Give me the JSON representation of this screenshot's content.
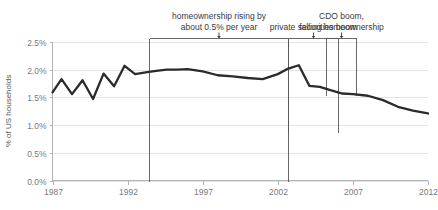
{
  "chart_data": {
    "type": "line",
    "title": "",
    "xlabel": "",
    "ylabel": "% of US households",
    "xlim": [
      1987,
      2012
    ],
    "ylim": [
      0.0,
      2.5
    ],
    "grid": true,
    "legend": "none",
    "x_ticks": [
      "1987",
      "1992",
      "1997",
      "2002",
      "2007",
      "2012"
    ],
    "x_tick_values": [
      1987,
      1992,
      1997,
      2002,
      2007,
      2012
    ],
    "y_ticks": [
      "0.0%",
      "0.5%",
      "1.0%",
      "1.5%",
      "2.0%",
      "2.5%"
    ],
    "y_tick_values": [
      0.0,
      0.5,
      1.0,
      1.5,
      2.0,
      2.5
    ],
    "series": [
      {
        "name": "% of US households",
        "x": [
          1987,
          1987.6,
          1988.3,
          1989.0,
          1989.7,
          1990.4,
          1991.1,
          1991.8,
          1992.5,
          1993.2,
          1993.9,
          1994.6,
          1995.3,
          1996.0,
          1997.0,
          1998.0,
          1999.0,
          2000.0,
          2001.0,
          2002.0,
          2002.7,
          2003.4,
          2004.1,
          2004.8,
          2005.5,
          2006.3,
          2007.0,
          2008.0,
          2009.0,
          2010.0,
          2011.0,
          2012.0
        ],
        "values": [
          1.59,
          1.83,
          1.56,
          1.81,
          1.47,
          1.93,
          1.7,
          2.07,
          1.92,
          1.95,
          1.98,
          2.0,
          2.0,
          2.01,
          1.97,
          1.9,
          1.88,
          1.85,
          1.83,
          1.92,
          2.02,
          2.08,
          1.71,
          1.69,
          1.63,
          1.57,
          1.56,
          1.53,
          1.45,
          1.33,
          1.26,
          1.21
        ]
      }
    ],
    "annotations": [
      {
        "id": "homeownership-rising",
        "lines": [
          "homeownership rising by",
          "about 0.5% per year"
        ],
        "x_start": 1993.4,
        "x_end": 2002.7,
        "bracket_top_pct": 2.57,
        "bracket_bottom_pct": 0.0,
        "pointer": "down"
      },
      {
        "id": "cdo-boom",
        "lines": [
          "CDO boom,",
          "falling homeownership"
        ],
        "x_start": 2005.2,
        "x_end": 2007.2,
        "bracket_top_pct": 2.57,
        "bracket_bottom_pct": 1.55,
        "pointer": "down"
      },
      {
        "id": "private-securities-boom",
        "lines": [
          "private securities boom"
        ],
        "x_start": 2002.7,
        "x_end": 2006.0,
        "bracket_top_pct": 2.57,
        "bracket_bottom_pct": 0.88,
        "pointer": "down"
      }
    ]
  },
  "axis": {
    "y_title": "% of US households"
  }
}
